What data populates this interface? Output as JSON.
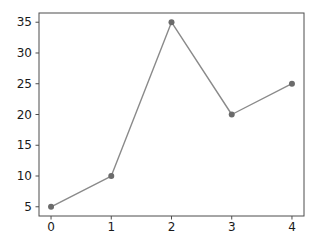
{
  "chart_data": {
    "type": "line",
    "x": [
      0,
      1,
      2,
      3,
      4
    ],
    "y": [
      5,
      10,
      35,
      20,
      25
    ],
    "title": "",
    "xlabel": "",
    "ylabel": "",
    "xticks": [
      0,
      1,
      2,
      3,
      4
    ],
    "xtick_labels": [
      "0",
      "1",
      "2",
      "3",
      "4"
    ],
    "yticks": [
      5,
      10,
      15,
      20,
      25,
      30,
      35
    ],
    "ytick_labels": [
      "5",
      "10",
      "15",
      "20",
      "25",
      "30",
      "35"
    ],
    "xlim": [
      -0.2,
      4.2
    ],
    "ylim": [
      3.5,
      36.5
    ],
    "grid": false,
    "legend": "none",
    "marker": "circle",
    "colors": {
      "line": "#8a8a8a",
      "marker": "#6b6b6b",
      "spine": "#4d4d4d",
      "tick": "#4d4d4d",
      "tick_label": "#1a1a1a",
      "background": "#ffffff"
    }
  }
}
